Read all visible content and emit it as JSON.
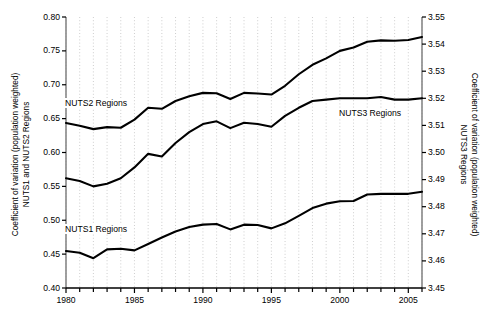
{
  "chart_data": {
    "type": "line",
    "title": "",
    "xlabel": "",
    "ylabel": "Coefficient of variation (population weighted)\nNUTS1 and NUTS2 Regions",
    "ylabel_right": "Coefficient of variation (population weighted)\nNUTS3 Regions",
    "xlim": [
      1980,
      2006
    ],
    "ylim": [
      0.4,
      0.8
    ],
    "ylim_right": [
      3.45,
      3.55
    ],
    "grid": "vertical-dotted",
    "legend": "inline-annotations",
    "xticks": [
      1980,
      1985,
      1990,
      1995,
      2000,
      2005
    ],
    "xtick_labels": [
      "1980",
      "1985",
      "1990",
      "1995",
      "2000",
      "2005"
    ],
    "xticks_minor": [
      1981,
      1982,
      1983,
      1984,
      1986,
      1987,
      1988,
      1989,
      1991,
      1992,
      1993,
      1994,
      1996,
      1997,
      1998,
      1999,
      2001,
      2002,
      2003,
      2004,
      2006
    ],
    "yticks_left": [
      0.4,
      0.45,
      0.5,
      0.55,
      0.6,
      0.65,
      0.7,
      0.75,
      0.8
    ],
    "ytick_labels_left": [
      "0.40",
      "0.45",
      "0.50",
      "0.55",
      "0.60",
      "0.65",
      "0.70",
      "0.75",
      "0.80"
    ],
    "yticks_right": [
      3.45,
      3.46,
      3.47,
      3.48,
      3.49,
      3.5,
      3.51,
      3.52,
      3.53,
      3.54,
      3.55
    ],
    "ytick_labels_right": [
      "3.45",
      "3.46",
      "3.47",
      "3.48",
      "3.49",
      "3.50",
      "3.51",
      "3.52",
      "3.53",
      "3.54",
      "3.55"
    ],
    "x": [
      1980,
      1981,
      1982,
      1983,
      1984,
      1985,
      1986,
      1987,
      1988,
      1989,
      1990,
      1991,
      1992,
      1993,
      1994,
      1995,
      1996,
      1997,
      1998,
      1999,
      2000,
      2001,
      2002,
      2003,
      2004,
      2005,
      2006
    ],
    "series": [
      {
        "name": "NUTS2 Regions",
        "axis": "left",
        "color": "#000000",
        "values": [
          0.6435,
          0.6395,
          0.6345,
          0.6375,
          0.6365,
          0.6485,
          0.666,
          0.6645,
          0.676,
          0.683,
          0.688,
          0.6875,
          0.679,
          0.688,
          0.687,
          0.6855,
          0.6985,
          0.7155,
          0.7295,
          0.739,
          0.75,
          0.755,
          0.7635,
          0.7655,
          0.765,
          0.766,
          0.7705
        ]
      },
      {
        "name": "NUTS3 Regions",
        "axis": "right",
        "color": "#000000",
        "values": [
          3.4905,
          3.4895,
          3.4875,
          3.4885,
          3.4905,
          3.4945,
          3.4995,
          3.4985,
          3.5035,
          3.5075,
          3.5105,
          3.5115,
          3.509,
          3.511,
          3.5105,
          3.5095,
          3.5135,
          3.5165,
          3.519,
          3.5195,
          3.52,
          3.52,
          3.52,
          3.5205,
          3.5195,
          3.5195,
          3.52
        ]
      },
      {
        "name": "NUTS1 Regions",
        "axis": "left",
        "color": "#000000",
        "values": [
          0.4545,
          0.452,
          0.444,
          0.457,
          0.458,
          0.4555,
          0.465,
          0.4745,
          0.4835,
          0.49,
          0.4935,
          0.4945,
          0.4865,
          0.4935,
          0.493,
          0.488,
          0.4955,
          0.5065,
          0.518,
          0.5245,
          0.528,
          0.5285,
          0.538,
          0.539,
          0.539,
          0.539,
          0.542
        ]
      }
    ],
    "annotations": [
      {
        "text": "NUTS2 Regions",
        "x_px": 64,
        "y_px": 98
      },
      {
        "text": "NUTS3 Regions",
        "x_px": 338,
        "y_px": 108
      },
      {
        "text": "NUTS1 Regions",
        "x_px": 64,
        "y_px": 224
      }
    ]
  }
}
